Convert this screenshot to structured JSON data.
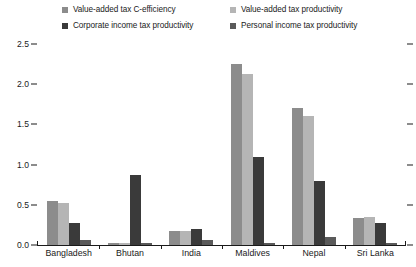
{
  "chart_data": {
    "type": "bar",
    "title": "",
    "subtitle": "",
    "xlabel": "",
    "ylabel": "",
    "ylim": [
      0.0,
      2.5
    ],
    "yticks": [
      "0.0",
      "0.5",
      "1.0",
      "1.5",
      "2.0",
      "2.5"
    ],
    "ytick_values": [
      0.0,
      0.5,
      1.0,
      1.5,
      2.0,
      2.5
    ],
    "grid": false,
    "legend_position": "top",
    "categories": [
      "Bangladesh",
      "Bhutan",
      "India",
      "Maldives",
      "Nepal",
      "Sri Lanka"
    ],
    "series": [
      {
        "name": "Value-added tax C-efficiency",
        "color": "#8c8c8c",
        "values": [
          0.55,
          0.02,
          0.17,
          2.25,
          1.7,
          0.33
        ]
      },
      {
        "name": "Value-added tax productivity",
        "color": "#b5b5b5",
        "values": [
          0.52,
          0.03,
          0.18,
          2.13,
          1.6,
          0.35
        ]
      },
      {
        "name": "Corporate income tax productivity",
        "color": "#3a3a3a",
        "values": [
          0.28,
          0.87,
          0.2,
          1.09,
          0.8,
          0.28
        ]
      },
      {
        "name": "Personal income tax productivity",
        "color": "#5a5a5a",
        "values": [
          0.06,
          0.02,
          0.06,
          0.03,
          0.1,
          0.02
        ]
      }
    ]
  },
  "legend": {
    "items": [
      {
        "label": "Value-added tax C-efficiency",
        "color": "#8c8c8c"
      },
      {
        "label": "Value-added tax productivity",
        "color": "#b5b5b5"
      },
      {
        "label": "Corporate income tax productivity",
        "color": "#3a3a3a"
      },
      {
        "label": "Personal income tax productivity",
        "color": "#5a5a5a"
      }
    ]
  },
  "axis": {
    "y_labels": [
      "2.5",
      "2.0",
      "1.5",
      "1.0",
      "0.5",
      "0.0"
    ],
    "x_labels": [
      "Bangladesh",
      "Bhutan",
      "India",
      "Maldives",
      "Nepal",
      "Sri Lanka"
    ]
  }
}
